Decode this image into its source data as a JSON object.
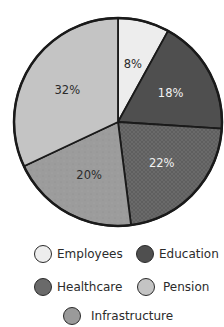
{
  "chart_data": {
    "type": "pie",
    "title": "",
    "start_angle_deg": 0,
    "direction": "clockwise",
    "slices": [
      {
        "label": "Employees",
        "value": 8,
        "display": "8%",
        "color": "#ededed",
        "label_color": "#2b2b2b",
        "pattern": "none"
      },
      {
        "label": "Education",
        "value": 18,
        "display": "18%",
        "color": "#4f4f4f",
        "label_color": "#f2f2f2",
        "pattern": "none"
      },
      {
        "label": "Healthcare",
        "value": 22,
        "display": "22%",
        "color": "#6a6a6a",
        "label_color": "#f2f2f2",
        "pattern": "crosshatch"
      },
      {
        "label": "Infrastructure",
        "value": 20,
        "display": "20%",
        "color": "#9a9a9a",
        "label_color": "#2b2b2b",
        "pattern": "speckle"
      },
      {
        "label": "Pension",
        "value": 32,
        "display": "32%",
        "color": "#c4c4c4",
        "label_color": "#2b2b2b",
        "pattern": "none"
      }
    ],
    "legend_position": "bottom",
    "legend": [
      "Employees",
      "Education",
      "Healthcare",
      "Pension",
      "Infrastructure"
    ]
  },
  "legend": {
    "items": [
      {
        "label": "Employees",
        "color": "#ededed"
      },
      {
        "label": "Education",
        "color": "#4f4f4f"
      },
      {
        "label": "Healthcare",
        "color": "#6a6a6a"
      },
      {
        "label": "Pension",
        "color": "#c4c4c4"
      },
      {
        "label": "Infrastructure",
        "color": "#9a9a9a"
      }
    ]
  }
}
